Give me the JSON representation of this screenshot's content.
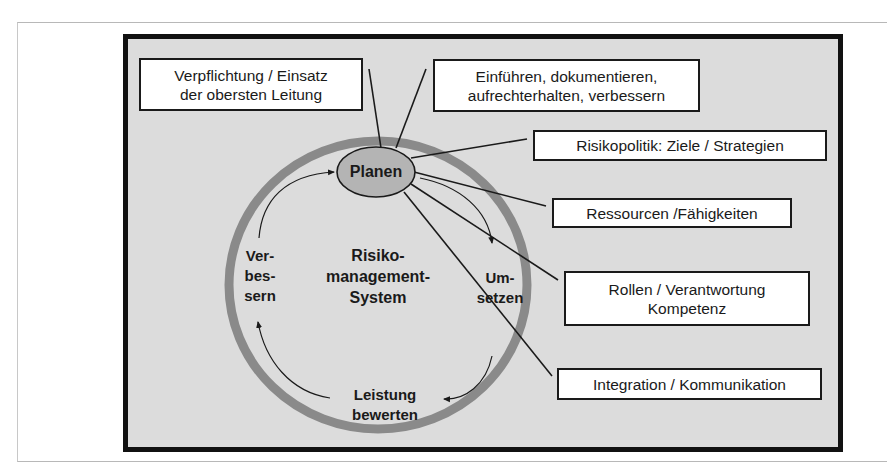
{
  "diagram": {
    "center_label": "Risiko-\nmanagement-\nSystem",
    "cycle_phases": [
      {
        "id": "planen",
        "label": "Planen"
      },
      {
        "id": "umsetzen",
        "label": "Um-\nsetzen"
      },
      {
        "id": "leistung-bewerten",
        "label": "Leistung\nbewerten"
      },
      {
        "id": "verbessern",
        "label": "Ver-\nbes-\nsern"
      }
    ],
    "boxes": [
      {
        "id": "verpflichtung",
        "label": "Verpflichtung / Einsatz\nder obersten Leitung"
      },
      {
        "id": "einfuehren",
        "label": "Einführen, dokumentieren,\naufrechterhalten, verbessern"
      },
      {
        "id": "risikopolitik",
        "label": "Risikopolitik: Ziele / Strategien"
      },
      {
        "id": "ressourcen",
        "label": "Ressourcen /Fähigkeiten"
      },
      {
        "id": "rollen",
        "label": "Rollen / Verantwortung\nKompetenz"
      },
      {
        "id": "integration",
        "label": "Integration / Kommunikation"
      }
    ],
    "colors": {
      "background": "#dcdcdc",
      "frame": "#111111",
      "ring": "#8a8a8a",
      "ellipse_fill": "#b4b4b4",
      "box_fill": "#ffffff",
      "line": "#1a1a1a"
    }
  }
}
